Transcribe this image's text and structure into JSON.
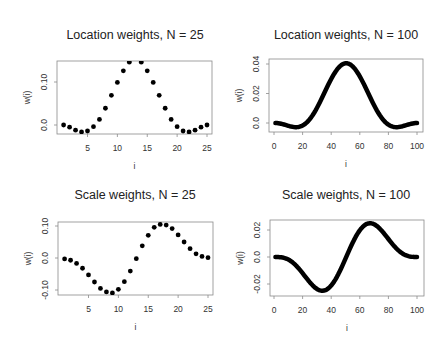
{
  "figure": {
    "background": "#ffffff",
    "point_color": "#000000",
    "axis_color": "#8a8a8a"
  },
  "chart_data": [
    {
      "id": "loc25",
      "type": "scatter",
      "title": "Location weights, N = 25",
      "xlabel": "i",
      "ylabel": "w(i)",
      "xlim": [
        0.5,
        25.5
      ],
      "ylim": [
        -0.02,
        0.15
      ],
      "xticks": [
        5,
        10,
        15,
        20,
        25
      ],
      "yticks": [
        0.0,
        0.1
      ],
      "ytick_labels": [
        "0.0",
        "0.10"
      ],
      "grid": false,
      "x": [
        1,
        2,
        3,
        4,
        5,
        6,
        7,
        8,
        9,
        10,
        11,
        12,
        13,
        14,
        15,
        16,
        17,
        18,
        19,
        20,
        21,
        22,
        23,
        24,
        25
      ],
      "y": [
        0.0,
        -0.005,
        -0.012,
        -0.016,
        -0.014,
        -0.004,
        0.013,
        0.039,
        0.069,
        0.099,
        0.126,
        0.146,
        0.155,
        0.146,
        0.126,
        0.099,
        0.069,
        0.039,
        0.013,
        -0.004,
        -0.014,
        -0.016,
        -0.012,
        -0.005,
        0.0
      ],
      "box": {
        "x0": 57,
        "y0": 61,
        "x1": 212,
        "y1": 134
      },
      "ymap": {
        "v0": 0.0,
        "p0": 125,
        "v1": 0.1,
        "p1": 82
      }
    },
    {
      "id": "loc100",
      "type": "scatter",
      "title": "Location weights, N = 100",
      "xlabel": "i",
      "ylabel": "w(i)",
      "xlim": [
        1,
        100
      ],
      "ylim": [
        -0.003,
        0.041
      ],
      "xticks": [
        0,
        20,
        40,
        60,
        80,
        100
      ],
      "yticks": [
        0.0,
        0.02,
        0.04
      ],
      "ytick_labels": [
        "0.0",
        "0.02",
        "0.04"
      ],
      "grid": false,
      "y": [
        -1e-05,
        -6e-05,
        -0.00017,
        -0.00032,
        -0.00053,
        -0.00076,
        -0.00103,
        -0.00131,
        -0.0016,
        -0.00189,
        -0.00216,
        -0.0024,
        -0.0026,
        -0.00274,
        -0.00281,
        -0.0028,
        -0.0027,
        -0.00248,
        -0.00216,
        -0.00171,
        -0.00113,
        -0.00042,
        0.00044,
        0.00143,
        0.00257,
        0.00385,
        0.00525,
        0.00678,
        0.00842,
        0.01017,
        0.01201,
        0.01392,
        0.0159,
        0.01792,
        0.01996,
        0.02201,
        0.02404,
        0.02604,
        0.02798,
        0.02984,
        0.03161,
        0.03326,
        0.03477,
        0.03615,
        0.03734,
        0.03837,
        0.0392,
        0.03983,
        0.04026,
        0.04047,
        0.04047,
        0.04026,
        0.03983,
        0.0392,
        0.03837,
        0.03734,
        0.03615,
        0.03477,
        0.03326,
        0.03161,
        0.02984,
        0.02798,
        0.02604,
        0.02404,
        0.02201,
        0.01996,
        0.01792,
        0.0159,
        0.01392,
        0.01201,
        0.01017,
        0.00842,
        0.00678,
        0.00525,
        0.00385,
        0.00257,
        0.00143,
        0.00044,
        -0.00042,
        -0.00113,
        -0.00171,
        -0.00216,
        -0.00248,
        -0.0027,
        -0.0028,
        -0.00281,
        -0.00274,
        -0.0026,
        -0.0024,
        -0.00216,
        -0.00189,
        -0.0016,
        -0.00131,
        -0.00103,
        -0.00076,
        -0.00053,
        -0.00032,
        -0.00017,
        -6e-05,
        -1e-05
      ],
      "box": {
        "x0": 269,
        "y0": 59,
        "x1": 423,
        "y1": 132
      },
      "xmap": {
        "v0": 0,
        "p0": 274,
        "v1": 100,
        "p1": 417
      },
      "ymap": {
        "v0": 0.0,
        "p0": 123,
        "v1": 0.04,
        "p1": 64
      }
    },
    {
      "id": "scale25",
      "type": "scatter",
      "title": "Scale weights, N = 25",
      "xlabel": "i",
      "ylabel": "w(i)",
      "xlim": [
        0.5,
        25.5
      ],
      "ylim": [
        -0.115,
        0.11
      ],
      "xticks": [
        5,
        10,
        15,
        20,
        25
      ],
      "yticks": [
        -0.1,
        0.0,
        0.1
      ],
      "ytick_labels": [
        "-0.10",
        "0.0",
        "0.10"
      ],
      "grid": false,
      "x": [
        1,
        2,
        3,
        4,
        5,
        6,
        7,
        8,
        9,
        10,
        11,
        12,
        13,
        14,
        15,
        16,
        17,
        18,
        19,
        20,
        21,
        22,
        23,
        24,
        25
      ],
      "y": [
        -0.003,
        -0.007,
        -0.017,
        -0.032,
        -0.053,
        -0.075,
        -0.095,
        -0.106,
        -0.109,
        -0.098,
        -0.074,
        -0.041,
        -0.002,
        0.038,
        0.071,
        0.096,
        0.105,
        0.103,
        0.092,
        0.072,
        0.05,
        0.029,
        0.013,
        0.005,
        0.001
      ],
      "box": {
        "x0": 58,
        "y0": 222,
        "x1": 213,
        "y1": 295
      },
      "ymap": {
        "v0": 0.0,
        "p0": 258,
        "v1": 0.1,
        "p1": 226
      }
    },
    {
      "id": "scale100",
      "type": "scatter",
      "title": "Scale weights, N = 100",
      "xlabel": "i",
      "ylabel": "w(i)",
      "xlim": [
        1,
        100
      ],
      "ylim": [
        -0.026,
        0.026
      ],
      "xticks": [
        0,
        20,
        40,
        60,
        80,
        100
      ],
      "yticks": [
        -0.02,
        0.0,
        0.02
      ],
      "ytick_labels": [
        "-0.02",
        "0.0",
        "0.02"
      ],
      "grid": false,
      "y": [
        0.0,
        -1e-05,
        -3e-05,
        -0.0001,
        -0.00021,
        -0.00038,
        -0.00063,
        -0.00095,
        -0.00136,
        -0.00188,
        -0.00247,
        -0.00319,
        -0.00399,
        -0.0049,
        -0.00589,
        -0.00698,
        -0.00814,
        -0.00937,
        -0.01066,
        -0.01198,
        -0.01334,
        -0.0147,
        -0.01604,
        -0.01738,
        -0.01865,
        -0.01985,
        -0.02098,
        -0.022,
        -0.0229,
        -0.02366,
        -0.02426,
        -0.0247,
        -0.02495,
        -0.02502,
        -0.02488,
        -0.02455,
        -0.024,
        -0.02325,
        -0.02229,
        -0.02113,
        -0.01978,
        -0.01824,
        -0.01653,
        -0.01467,
        -0.01266,
        -0.01053,
        -0.0083,
        -0.00599,
        -0.00362,
        -0.00121,
        0.00121,
        0.00362,
        0.00599,
        0.0083,
        0.01053,
        0.01266,
        0.01467,
        0.01653,
        0.01824,
        0.01978,
        0.02113,
        0.02229,
        0.02325,
        0.024,
        0.02455,
        0.02488,
        0.02502,
        0.02495,
        0.0247,
        0.02426,
        0.02366,
        0.0229,
        0.022,
        0.02098,
        0.01985,
        0.01865,
        0.01738,
        0.01604,
        0.0147,
        0.01334,
        0.01198,
        0.01066,
        0.00937,
        0.00814,
        0.00698,
        0.00589,
        0.0049,
        0.00399,
        0.00319,
        0.00247,
        0.00188,
        0.00136,
        0.00095,
        0.00063,
        0.00038,
        0.00021,
        0.0001,
        3e-05,
        1e-05,
        0.0
      ],
      "box": {
        "x0": 270,
        "y0": 220,
        "x1": 424,
        "y1": 296
      },
      "xmap": {
        "v0": 0,
        "p0": 274,
        "v1": 100,
        "p1": 417
      },
      "ymap": {
        "v0": 0.0,
        "p0": 257,
        "v1": 0.02,
        "p1": 230
      }
    }
  ],
  "titles": {
    "loc25": "Location weights, N = 25",
    "loc100": "Location weights, N = 100",
    "scale25": "Scale weights, N = 25",
    "scale100": "Scale weights, N = 100"
  },
  "axis_labels": {
    "x": "i",
    "y": "w(i)"
  }
}
